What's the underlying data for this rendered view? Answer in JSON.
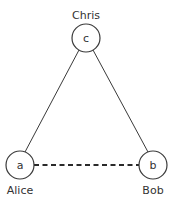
{
  "diagram": {
    "type": "graph",
    "nodes": [
      {
        "id": "c",
        "letter": "c",
        "name": "Chris",
        "cx": 86,
        "cy": 38,
        "r": 14,
        "label_y": 15
      },
      {
        "id": "a",
        "letter": "a",
        "name": "Alice",
        "cx": 20,
        "cy": 165,
        "r": 14,
        "label_y": 190
      },
      {
        "id": "b",
        "letter": "b",
        "name": "Bob",
        "cx": 153,
        "cy": 165,
        "r": 14,
        "label_y": 190
      }
    ],
    "edges": [
      {
        "from": "c",
        "to": "a",
        "style": "solid"
      },
      {
        "from": "c",
        "to": "b",
        "style": "solid"
      },
      {
        "from": "a",
        "to": "b",
        "style": "dashed"
      }
    ],
    "colors": {
      "stroke": "#3a3a3a",
      "text": "#333333",
      "background": "#ffffff"
    }
  }
}
